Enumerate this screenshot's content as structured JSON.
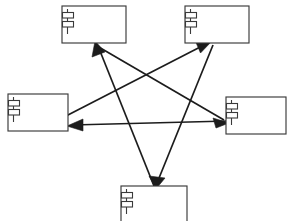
{
  "diagram": {
    "kind": "uml-component-diagram",
    "title": "",
    "canvas": {
      "width": 287,
      "height": 221,
      "background": "#ffffff"
    },
    "style": {
      "component_stroke": "#3a3a3a",
      "component_fill": "#ffffff",
      "connector_stroke": "#1c1c1c",
      "connector_width": 1.7
    },
    "components": [
      {
        "id": "comp-top-left",
        "name": "",
        "icon": "uml-component-icon",
        "x": 62,
        "y": 6,
        "width": 64,
        "height": 37
      },
      {
        "id": "comp-top-right",
        "name": "",
        "icon": "uml-component-icon",
        "x": 185,
        "y": 6,
        "width": 64,
        "height": 37
      },
      {
        "id": "comp-left",
        "name": "",
        "icon": "uml-component-icon",
        "x": 8,
        "y": 94,
        "width": 60,
        "height": 37
      },
      {
        "id": "comp-right",
        "name": "",
        "icon": "uml-component-icon",
        "x": 226,
        "y": 97,
        "width": 60,
        "height": 37
      },
      {
        "id": "comp-bottom",
        "name": "",
        "icon": "uml-component-icon",
        "x": 121,
        "y": 186,
        "width": 66,
        "height": 38
      }
    ],
    "connectors": [
      {
        "id": "conn-left-to-topright",
        "from": "comp-left",
        "to": "comp-top-right",
        "arrow": "open-filled",
        "x1": 66,
        "y1": 116,
        "x2": 210,
        "y2": 42
      },
      {
        "id": "conn-topright-to-bottom",
        "from": "comp-top-right",
        "to": "comp-bottom",
        "arrow": "open-filled",
        "x1": 212,
        "y1": 44,
        "x2": 156,
        "y2": 186
      },
      {
        "id": "conn-bottom-to-topleft",
        "from": "comp-bottom",
        "to": "comp-top-left",
        "arrow": "open-filled",
        "x1": 154,
        "y1": 186,
        "x2": 96,
        "y2": 43
      },
      {
        "id": "conn-topleft-to-right",
        "from": "comp-top-left",
        "to": "comp-right",
        "arrow": "open-filled",
        "x1": 95,
        "y1": 45,
        "x2": 226,
        "y2": 122
      },
      {
        "id": "conn-right-to-left",
        "from": "comp-right",
        "to": "comp-left",
        "arrow": "open-filled",
        "x1": 228,
        "y1": 122,
        "x2": 68,
        "y2": 126
      }
    ]
  }
}
